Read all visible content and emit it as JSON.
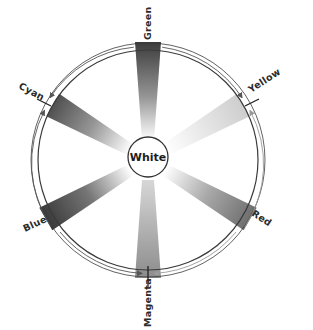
{
  "diagram": {
    "center": {
      "label": "White"
    },
    "colors": [
      {
        "id": "green",
        "label": "Green",
        "angle_deg": 0,
        "shade": "#3c3c3c",
        "strength": 0.95
      },
      {
        "id": "yellow",
        "label": "Yellow",
        "angle_deg": 60,
        "shade": "#c8c8c8",
        "strength": 0.55
      },
      {
        "id": "red",
        "label": "Red",
        "angle_deg": 120,
        "shade": "#6e6e6e",
        "strength": 0.8
      },
      {
        "id": "magenta",
        "label": "Magenta",
        "angle_deg": 180,
        "shade": "#8c8c8c",
        "strength": 0.75
      },
      {
        "id": "blue",
        "label": "Blue",
        "angle_deg": 240,
        "shade": "#3a3a3a",
        "strength": 0.95
      },
      {
        "id": "cyan",
        "label": "Cyan",
        "angle_deg": 300,
        "shade": "#505050",
        "strength": 0.85
      }
    ],
    "ticks": [
      "Cyan",
      "Yellow",
      "Magenta"
    ],
    "arrows": [
      {
        "from": "Green",
        "to": "Yellow",
        "direction": "clockwise"
      },
      {
        "from": "Red",
        "to": "Yellow",
        "direction": "counterclockwise"
      },
      {
        "from": "Green",
        "to": "Cyan",
        "direction": "counterclockwise"
      },
      {
        "from": "Blue",
        "to": "Cyan",
        "direction": "clockwise"
      },
      {
        "from": "Blue",
        "to": "Magenta",
        "direction": "counterclockwise"
      },
      {
        "from": "Red",
        "to": "Magenta",
        "direction": "clockwise"
      }
    ]
  },
  "labels": {
    "green": "Green",
    "yellow": "Yellow",
    "red": "Red",
    "magenta": "Magenta",
    "blue": "Blue",
    "cyan": "Cyan",
    "white": "White"
  }
}
